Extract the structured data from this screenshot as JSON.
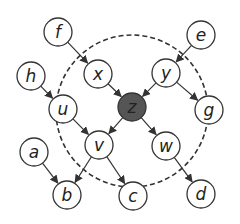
{
  "diagram": {
    "type": "directed-graph",
    "boundary": {
      "cx": 132,
      "cy": 111,
      "r": 76,
      "style": "dashed",
      "color": "#333333"
    },
    "node_radius": 14,
    "colors": {
      "node_fill": "#ffffff",
      "node_stroke": "#333333",
      "highlight_fill": "#555555",
      "edge": "#333333",
      "text": "#222222"
    },
    "nodes": [
      {
        "id": "f",
        "label": "f",
        "x": 58,
        "y": 32,
        "highlight": false
      },
      {
        "id": "e",
        "label": "e",
        "x": 201,
        "y": 35,
        "highlight": false
      },
      {
        "id": "h",
        "label": "h",
        "x": 31,
        "y": 76,
        "highlight": false
      },
      {
        "id": "x",
        "label": "x",
        "x": 98,
        "y": 74,
        "highlight": false
      },
      {
        "id": "y",
        "label": "y",
        "x": 166,
        "y": 73,
        "highlight": false
      },
      {
        "id": "u",
        "label": "u",
        "x": 63,
        "y": 109,
        "highlight": false
      },
      {
        "id": "z",
        "label": "z",
        "x": 132,
        "y": 107,
        "highlight": true
      },
      {
        "id": "g",
        "label": "g",
        "x": 209,
        "y": 110,
        "highlight": false
      },
      {
        "id": "v",
        "label": "v",
        "x": 99,
        "y": 145,
        "highlight": false
      },
      {
        "id": "w",
        "label": "w",
        "x": 166,
        "y": 146,
        "highlight": false
      },
      {
        "id": "a",
        "label": "a",
        "x": 34,
        "y": 152,
        "highlight": false
      },
      {
        "id": "b",
        "label": "b",
        "x": 67,
        "y": 195,
        "highlight": false
      },
      {
        "id": "c",
        "label": "c",
        "x": 133,
        "y": 196,
        "highlight": false
      },
      {
        "id": "d",
        "label": "d",
        "x": 201,
        "y": 194,
        "highlight": false
      }
    ],
    "edges": [
      {
        "from": "f",
        "to": "x"
      },
      {
        "from": "e",
        "to": "y"
      },
      {
        "from": "h",
        "to": "u"
      },
      {
        "from": "x",
        "to": "z"
      },
      {
        "from": "y",
        "to": "z"
      },
      {
        "from": "y",
        "to": "g"
      },
      {
        "from": "u",
        "to": "v"
      },
      {
        "from": "z",
        "to": "v"
      },
      {
        "from": "z",
        "to": "w"
      },
      {
        "from": "a",
        "to": "b"
      },
      {
        "from": "v",
        "to": "b"
      },
      {
        "from": "v",
        "to": "c"
      },
      {
        "from": "w",
        "to": "d"
      }
    ]
  }
}
